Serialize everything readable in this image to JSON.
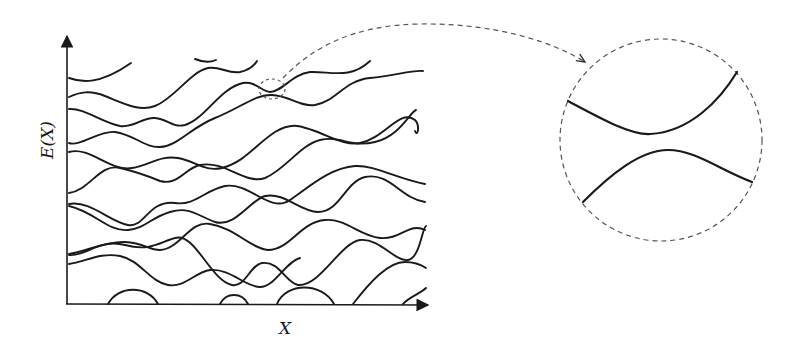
{
  "diagram": {
    "y_axis_label": "E(X)",
    "x_axis_label": "X",
    "colors": {
      "line": "#1a1a1a",
      "dash": "#555555",
      "background": "#ffffff"
    },
    "axes": {
      "origin": [
        67,
        304
      ],
      "y_tip": [
        68,
        31
      ],
      "x_tip": [
        433,
        305
      ]
    },
    "curves": [
      "M69,78 C80,82 98,86 131,63",
      "M195,59 Q207,64 216,60",
      "M69,97 C80,92 90,90 105,96 C125,104 140,112 155,106 C175,98 190,72 208,68 C220,66 228,74 240,72 C250,70 254,66 257,61",
      "M69,109 C85,108 100,122 120,126 C135,128 142,117 155,118 C168,119 172,128 185,125 C205,119 220,88 243,83 C256,81 262,92 270,92 C282,92 292,74 310,72 C330,71 350,80 370,61",
      "M69,143 C80,147 100,130 115,132 C135,135 145,148 160,147 C178,146 190,128 215,118 C240,108 256,94 272,95 C290,96 300,107 315,105 C335,102 345,80 370,78 C395,76 410,70 423,71",
      "M69,152 C90,146 110,172 132,168 C150,165 160,155 178,158 C195,161 205,172 222,168 C245,162 255,145 275,132 C292,122 300,126 312,130 C330,136 345,146 360,143 C385,138 400,108 415,120 C420,125 418,138 415,131",
      "M69,193 C90,190 100,163 120,168 C138,172 148,176 160,181 C178,186 185,168 200,165 C225,160 245,185 265,178 C285,170 300,145 320,140 C340,135 350,148 375,142 C400,136 410,112 416,110",
      "M69,204 C90,200 110,222 128,225 C145,228 148,200 175,203 C195,206 205,190 225,186 C250,182 270,214 290,200 C310,186 330,168 355,166 C375,165 395,178 425,184",
      "M69,206 C95,212 108,232 128,230 C146,228 150,218 170,212 C190,206 198,216 215,222 C235,228 250,200 265,196 C285,192 300,212 318,212 C340,212 345,182 365,177 C390,172 400,198 425,202",
      "M69,254 C85,252 105,241 125,242 C145,243 148,250 160,250 C180,249 190,220 210,224 C235,228 250,248 268,250 C290,250 300,222 325,220 C345,218 360,236 380,238 C400,240 410,222 425,230",
      "M69,255 C85,257 100,238 125,245 C150,252 160,242 175,238 C195,232 210,280 232,285 C245,288 250,265 262,263 C280,261 285,282 298,285 C320,287 340,243 360,240 C380,238 395,262 408,260 C420,258 422,228 426,226",
      "M69,264 C85,262 100,252 120,256 C140,260 150,282 168,285 C185,288 195,272 210,270 C230,268 245,287 260,287 C275,287 285,262 300,258",
      "M108,304 C118,285 148,285 158,304",
      "M220,304 C226,292 242,292 248,304",
      "M277,304 C286,282 322,282 334,304",
      "M353,304 C370,282 388,262 405,262 C415,262 420,264 426,268",
      "M403,304 C410,296 420,294 426,288"
    ],
    "highlight_ellipse": {
      "cx": 272,
      "cy": 89,
      "rx": 13,
      "ry": 10
    },
    "connector_path": "M283,78 C310,50 350,25 420,24 C490,23 550,40 585,62",
    "magnified_circle": {
      "cx": 661,
      "cy": 140,
      "r": 101
    },
    "magnified_curves": {
      "upper": "M568,101 C600,118 630,135 650,134 C690,132 720,100 737,72",
      "lower": "M583,202 C610,175 640,150 668,150 C695,150 720,170 752,182"
    }
  }
}
